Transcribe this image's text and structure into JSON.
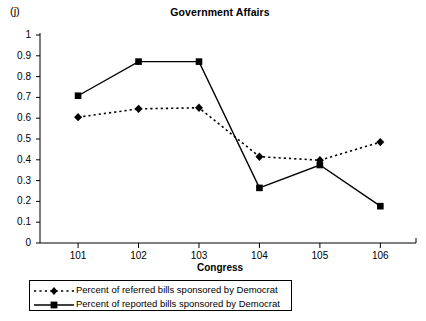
{
  "panel": {
    "label": "(j)"
  },
  "chart_data": {
    "type": "line",
    "title": "Government Affairs",
    "xlabel": "Congress",
    "ylabel": "",
    "categories": [
      "101",
      "102",
      "103",
      "104",
      "105",
      "106"
    ],
    "ylim": [
      0,
      1
    ],
    "ytick_labels": [
      "1",
      "0.9",
      "0.8",
      "0.7",
      "0.6",
      "0.5",
      "0.4",
      "0.3",
      "0.2",
      "0.1",
      "0"
    ],
    "ytick_values": [
      1,
      0.9,
      0.8,
      0.7,
      0.6,
      0.5,
      0.4,
      0.3,
      0.2,
      0.1,
      0
    ],
    "grid": false,
    "legend_position": "below",
    "series": [
      {
        "name": "Percent of referred bills sponsored by Democrat",
        "marker": "diamond",
        "line_style": "dotted",
        "color": "#000000",
        "values": [
          0.605,
          0.645,
          0.65,
          0.415,
          0.398,
          0.485
        ]
      },
      {
        "name": "Percent of reported bills sponsored by Democrat",
        "marker": "square",
        "line_style": "solid",
        "color": "#000000",
        "values": [
          0.708,
          0.872,
          0.872,
          0.265,
          0.375,
          0.177
        ]
      }
    ]
  }
}
